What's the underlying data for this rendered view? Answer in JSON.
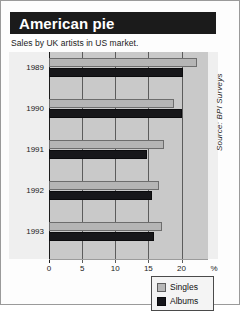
{
  "header": {
    "title": "American pie",
    "subtitle": "Sales by UK artists in US market."
  },
  "legend": {
    "items": [
      {
        "label": "Singles",
        "color": "#b7b7b7",
        "icon": "legend-swatch-icon"
      },
      {
        "label": "Albums",
        "color": "#16161a",
        "icon": "legend-swatch-icon"
      }
    ]
  },
  "source": "Source: BPI Surveys",
  "axis": {
    "unit": "%",
    "ticks": [
      "0",
      "5",
      "10",
      "15",
      "20"
    ]
  },
  "colors": {
    "title_bar": "#1b1b1b",
    "plot_background": "#c9c9c9",
    "singles": "#b5b5b5",
    "albums": "#17171a",
    "gridline": "#5c5c5c"
  },
  "chart_data": {
    "type": "bar",
    "orientation": "horizontal",
    "title": "American pie",
    "subtitle": "Sales by UK artists in US market.",
    "xlabel": "%",
    "ylabel": "",
    "xlim": [
      0,
      24
    ],
    "grid": true,
    "legend_position": "bottom-right",
    "xticks": [
      0,
      5,
      10,
      15,
      20
    ],
    "categories": [
      "1989",
      "1990",
      "1991",
      "1992",
      "1993"
    ],
    "series": [
      {
        "name": "Singles",
        "color": "#b5b5b5",
        "values": [
          22.3,
          18.9,
          17.3,
          16.6,
          17.0
        ]
      },
      {
        "name": "Albums",
        "color": "#17171a",
        "values": [
          20.2,
          20.0,
          14.8,
          15.6,
          15.8
        ]
      }
    ],
    "source": "Source: BPI Surveys"
  }
}
